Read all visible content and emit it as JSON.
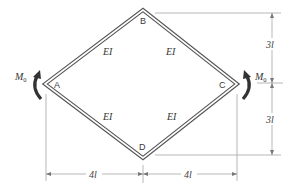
{
  "diagram": {
    "type": "rhombic closed frame",
    "nodes": [
      {
        "id": "A",
        "label": "A",
        "x": 45,
        "y": 84
      },
      {
        "id": "B",
        "label": "B",
        "x": 143,
        "y": 10
      },
      {
        "id": "C",
        "label": "C",
        "x": 237,
        "y": 84
      },
      {
        "id": "D",
        "label": "D",
        "x": 143,
        "y": 158
      }
    ],
    "members": [
      {
        "from": "A",
        "to": "B",
        "label": "EI"
      },
      {
        "from": "B",
        "to": "C",
        "label": "EI"
      },
      {
        "from": "A",
        "to": "D",
        "label": "EI"
      },
      {
        "from": "D",
        "to": "C",
        "label": "EI"
      }
    ],
    "loads": [
      {
        "node": "A",
        "type": "moment",
        "label": "M",
        "subscript": "0",
        "direction": "clockwise"
      },
      {
        "node": "C",
        "type": "moment",
        "label": "M",
        "subscript": "0",
        "direction": "counterclockwise"
      }
    ],
    "dimensions": {
      "horizontal": [
        {
          "label": "4l"
        },
        {
          "label": "4l"
        }
      ],
      "vertical": [
        {
          "label": "3l"
        },
        {
          "label": "3l"
        }
      ]
    }
  },
  "labels": {
    "node_a": "A",
    "node_b": "B",
    "node_c": "C",
    "node_d": "D",
    "ei_ab": "EI",
    "ei_bc": "EI",
    "ei_ad": "EI",
    "ei_dc": "EI",
    "moment_left": "M",
    "moment_left_sub": "0",
    "moment_right": "M",
    "moment_right_sub": "0",
    "dim_bottom_left": "4l",
    "dim_bottom_right": "4l",
    "dim_right_top": "3l",
    "dim_right_bottom": "3l"
  },
  "colors": {
    "frame": "#555555",
    "moment_arrow": "#333333",
    "dimension": "#888888"
  }
}
